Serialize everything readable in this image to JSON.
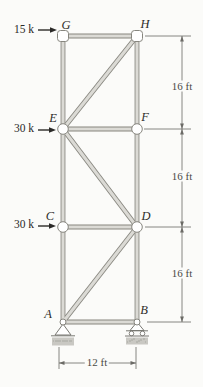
{
  "labels": {
    "A": "A",
    "B": "B",
    "C": "C",
    "D": "D",
    "E": "E",
    "F": "F",
    "G": "G",
    "H": "H"
  },
  "loads": {
    "g": "15 k",
    "e": "30 k",
    "c": "30 k"
  },
  "dims": {
    "right": [
      "16 ft",
      "16 ft",
      "16 ft"
    ],
    "bottom": "12 ft"
  },
  "colors": {
    "background": "#fbfbf9",
    "member_edge": "#87867f",
    "member_fill": "#dbdad5",
    "dim": "#6b6a66",
    "load": "#2b2a28",
    "support": "#7a7974",
    "ground": "#c9c8c3",
    "ground_dot": "#a8a7a1"
  },
  "geometry": {
    "width": 203,
    "height": 387,
    "joints": {
      "A": [
        63,
        322
      ],
      "B": [
        137,
        322
      ],
      "C": [
        63,
        227
      ],
      "D": [
        137,
        227
      ],
      "E": [
        63,
        129
      ],
      "F": [
        137,
        129
      ],
      "G": [
        63,
        36
      ],
      "H": [
        137,
        36
      ]
    },
    "members": [
      [
        "A",
        "C"
      ],
      [
        "C",
        "E"
      ],
      [
        "E",
        "G"
      ],
      [
        "B",
        "D"
      ],
      [
        "D",
        "F"
      ],
      [
        "F",
        "H"
      ],
      [
        "G",
        "H"
      ],
      [
        "E",
        "F"
      ],
      [
        "C",
        "D"
      ],
      [
        "A",
        "B"
      ],
      [
        "H",
        "E"
      ],
      [
        "E",
        "D"
      ],
      [
        "D",
        "A"
      ]
    ],
    "joint_circles": [
      "C",
      "D",
      "E",
      "F"
    ],
    "joint_blocks": [
      "G",
      "H"
    ],
    "joint_pins": [
      "A",
      "B"
    ],
    "supports": {
      "pin": "A",
      "roller": "B"
    },
    "load_arrows": [
      [
        38,
        30,
        57
      ],
      [
        38,
        130,
        56
      ],
      [
        38,
        226,
        56
      ]
    ],
    "ext_lines": [
      [
        145,
        36,
        191,
        36
      ],
      [
        144,
        129,
        191,
        129
      ],
      [
        145,
        227,
        191,
        227
      ],
      [
        147,
        322,
        191,
        322
      ],
      [
        59,
        347,
        59,
        369
      ],
      [
        136,
        347,
        136,
        369
      ]
    ],
    "dim_lines": [
      [
        182,
        36,
        182,
        322
      ],
      [
        59,
        363,
        136,
        363
      ]
    ],
    "dim_arrows": [
      [
        182,
        36,
        "up"
      ],
      [
        182,
        129,
        "down"
      ],
      [
        182,
        129,
        "up"
      ],
      [
        182,
        227,
        "down"
      ],
      [
        182,
        227,
        "up"
      ],
      [
        182,
        322,
        "down"
      ],
      [
        59,
        363,
        "left"
      ],
      [
        136,
        363,
        "right"
      ]
    ]
  }
}
